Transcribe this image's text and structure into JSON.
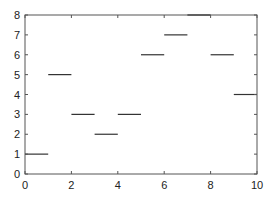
{
  "chart_data": {
    "type": "line",
    "subtype": "step-segments",
    "title": "",
    "xlabel": "",
    "ylabel": "",
    "xlim": [
      0,
      10
    ],
    "ylim": [
      0,
      8
    ],
    "grid": false,
    "legend": null,
    "x_ticks": [
      0,
      2,
      4,
      6,
      8,
      10
    ],
    "y_ticks": [
      0,
      1,
      2,
      3,
      4,
      5,
      6,
      7,
      8
    ],
    "series": [
      {
        "name": "segments",
        "color": "#333333",
        "segments": [
          {
            "x0": 0,
            "x1": 1,
            "y": 1
          },
          {
            "x0": 1,
            "x1": 2,
            "y": 5
          },
          {
            "x0": 2,
            "x1": 3,
            "y": 3
          },
          {
            "x0": 3,
            "x1": 4,
            "y": 2
          },
          {
            "x0": 4,
            "x1": 5,
            "y": 3
          },
          {
            "x0": 5,
            "x1": 6,
            "y": 6
          },
          {
            "x0": 6,
            "x1": 7,
            "y": 7
          },
          {
            "x0": 7,
            "x1": 8,
            "y": 8
          },
          {
            "x0": 8,
            "x1": 9,
            "y": 6
          },
          {
            "x0": 9,
            "x1": 10,
            "y": 4
          }
        ]
      }
    ]
  },
  "colors": {
    "axis": "#555555",
    "line": "#333333",
    "background": "#ffffff"
  }
}
